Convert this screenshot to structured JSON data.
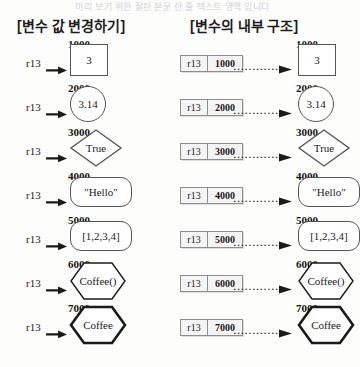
{
  "page": {
    "cut_off_top_line": "미리 보기 위한 잘린 본문 한 줄 텍스트 영역 입니다",
    "background_color": "#fdfdfc",
    "ink_color": "#1a1a1a"
  },
  "headers": {
    "left": "[변수 값 변경하기]",
    "right": "[변수의 내부 구조]"
  },
  "labels": {
    "variable_name": "r13"
  },
  "chart_data": {
    "type": "diagram",
    "rows": [
      {
        "address": "1000",
        "value": "3",
        "shape": "rect"
      },
      {
        "address": "2000",
        "value": "3.14",
        "shape": "circle"
      },
      {
        "address": "3000",
        "value": "True",
        "shape": "diamond"
      },
      {
        "address": "4000",
        "value": "\"Hello\"",
        "shape": "rounded"
      },
      {
        "address": "5000",
        "value": "[1,2,3,4]",
        "shape": "rounded"
      },
      {
        "address": "6000",
        "value": "Coffee()",
        "shape": "hexagon"
      },
      {
        "address": "7000",
        "value": "Coffee",
        "shape": "hexagon-bold"
      }
    ]
  }
}
